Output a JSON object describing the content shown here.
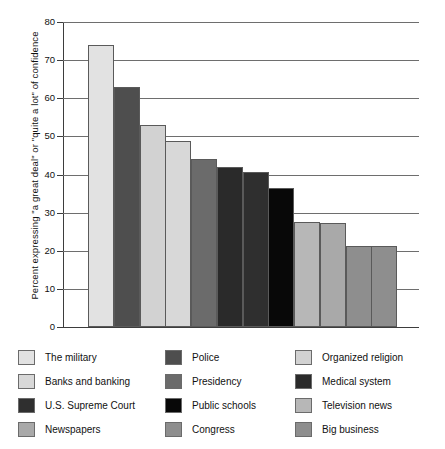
{
  "chart_data": {
    "type": "bar",
    "title": "",
    "xlabel": "",
    "ylabel": "Percent expressing \"a great deal\" or \"quite a lot\" of confidence",
    "ylim": [
      0,
      80
    ],
    "yticks": [
      "0",
      "10",
      "20",
      "30",
      "40",
      "50",
      "60",
      "70",
      "80"
    ],
    "ytick_values": [
      0,
      10,
      20,
      30,
      40,
      50,
      60,
      70,
      80
    ],
    "grid": "horizontal",
    "legend_position": "bottom",
    "categories": [
      "The military",
      "Police",
      "Organized religion",
      "Banks and banking",
      "Presidency",
      "Medical system",
      "U.S. Supreme Court",
      "Public schools",
      "Television news",
      "Newspapers",
      "Congress",
      "Big business"
    ],
    "values": [
      74,
      63,
      53,
      48.7,
      44,
      42,
      40.7,
      36.4,
      27.5,
      27.3,
      21.3,
      21.3
    ],
    "colors": [
      "#e2e2e2",
      "#4e4e4e",
      "#d2d2d2",
      "#d8d8d8",
      "#6b6b6b",
      "#2a2a2a",
      "#2f2f2f",
      "#080808",
      "#b7b7b7",
      "#a9a9a9",
      "#8e8e8e",
      "#8e8e8e"
    ],
    "bar_order_labels": [
      "The military",
      "Police",
      "Organized religion",
      "Banks and banking",
      "Presidency",
      "Medical system",
      "U.S. Supreme Court",
      "Public schools",
      "Television news",
      "Newspapers",
      "Congress",
      "Big business"
    ]
  },
  "legend": {
    "columns": [
      {
        "entries": [
          {
            "label": "The military",
            "color": "#e2e2e2"
          },
          {
            "label": "Banks and banking",
            "color": "#d8d8d8"
          },
          {
            "label": "U.S. Supreme Court",
            "color": "#2f2f2f"
          },
          {
            "label": "Newspapers",
            "color": "#a9a9a9"
          }
        ]
      },
      {
        "entries": [
          {
            "label": "Police",
            "color": "#4e4e4e"
          },
          {
            "label": "Presidency",
            "color": "#6b6b6b"
          },
          {
            "label": "Public schools",
            "color": "#080808"
          },
          {
            "label": "Congress",
            "color": "#8e8e8e"
          }
        ]
      },
      {
        "entries": [
          {
            "label": "Organized religion",
            "color": "#d2d2d2"
          },
          {
            "label": "Medical system",
            "color": "#2a2a2a"
          },
          {
            "label": "Television news",
            "color": "#b7b7b7"
          },
          {
            "label": "Big business",
            "color": "#8e8e8e"
          }
        ]
      }
    ]
  }
}
